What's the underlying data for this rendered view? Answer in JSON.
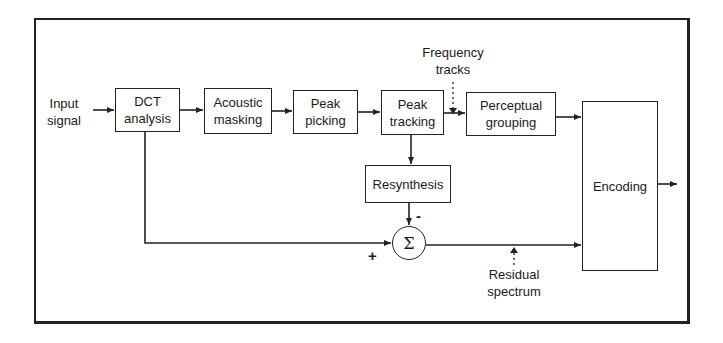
{
  "diagram": {
    "type": "block-diagram",
    "title": "",
    "inputs": [
      {
        "id": "input_signal",
        "label_lines": [
          "Input",
          "signal"
        ]
      }
    ],
    "blocks": [
      {
        "id": "dct",
        "label_lines": [
          "DCT",
          "analysis"
        ]
      },
      {
        "id": "acoustic",
        "label_lines": [
          "Acoustic",
          "masking"
        ]
      },
      {
        "id": "peak_picking",
        "label_lines": [
          "Peak",
          "picking"
        ]
      },
      {
        "id": "peak_tracking",
        "label_lines": [
          "Peak",
          "tracking"
        ]
      },
      {
        "id": "perceptual",
        "label_lines": [
          "Perceptual",
          "grouping"
        ]
      },
      {
        "id": "resynthesis",
        "label_lines": [
          "Resynthesis"
        ]
      },
      {
        "id": "encoding",
        "label_lines": [
          "Encoding"
        ]
      }
    ],
    "summing_junction": {
      "id": "sum",
      "symbol": "Σ",
      "plus_sign": "+",
      "minus_sign": "-"
    },
    "annotations": [
      {
        "id": "frequency_tracks",
        "label_lines": [
          "Frequency",
          "tracks"
        ],
        "style": "dotted-arrow"
      },
      {
        "id": "residual_spectrum",
        "label_lines": [
          "Residual",
          "spectrum"
        ],
        "style": "dotted-arrow"
      }
    ],
    "edges": [
      {
        "from": "input_signal",
        "to": "dct"
      },
      {
        "from": "dct",
        "to": "acoustic"
      },
      {
        "from": "acoustic",
        "to": "peak_picking"
      },
      {
        "from": "peak_picking",
        "to": "peak_tracking"
      },
      {
        "from": "peak_tracking",
        "to": "perceptual"
      },
      {
        "from": "perceptual",
        "to": "encoding"
      },
      {
        "from": "peak_tracking",
        "to": "resynthesis"
      },
      {
        "from": "resynthesis",
        "to": "sum",
        "sign": "-"
      },
      {
        "from": "dct",
        "to": "sum",
        "sign": "+"
      },
      {
        "from": "sum",
        "to": "encoding"
      },
      {
        "from": "encoding",
        "to": "output"
      }
    ]
  }
}
